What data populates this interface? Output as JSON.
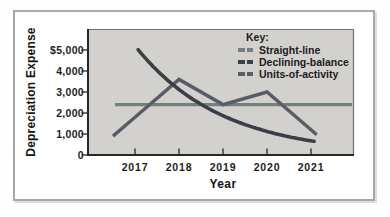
{
  "chart_data": {
    "type": "line",
    "xlabel": "Year",
    "ylabel": "Depreciation Expense",
    "x_categories": [
      "2017",
      "2018",
      "2019",
      "2020",
      "2021"
    ],
    "ytick_labels": [
      "$5,000",
      "4,000",
      "3,000",
      "2,000",
      "1,000",
      "0"
    ],
    "ytick_values": [
      5000,
      4000,
      3000,
      2000,
      1000,
      0
    ],
    "ylim": [
      0,
      5500
    ],
    "grid": false,
    "legend": {
      "title": "Key:",
      "position": "top-right-inside"
    },
    "series": [
      {
        "name": "Straight-line",
        "values": [
          2400,
          2400,
          2400,
          2400,
          2400
        ],
        "color": "#74807d",
        "style": "straight"
      },
      {
        "name": "Declining-balance",
        "values": [
          5200,
          3120,
          1872,
          1123,
          674
        ],
        "color": "#3a3f47",
        "style": "smooth"
      },
      {
        "name": "Units-of-activity",
        "values": [
          1800,
          3600,
          2400,
          3000,
          1200
        ],
        "color": "#595c66",
        "style": "linear"
      }
    ],
    "colors": {
      "plot_background": "#d2d1cd",
      "axis": "#262626",
      "plot_border_light": "#707070",
      "text": "#1c1c1c"
    }
  }
}
